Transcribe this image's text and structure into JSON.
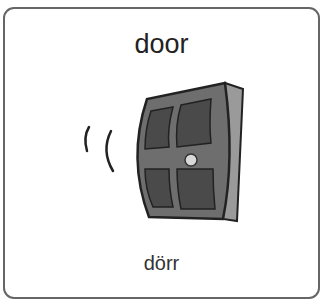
{
  "card": {
    "word": "door",
    "translation": "dörr",
    "image": "door-swinging-icon"
  }
}
